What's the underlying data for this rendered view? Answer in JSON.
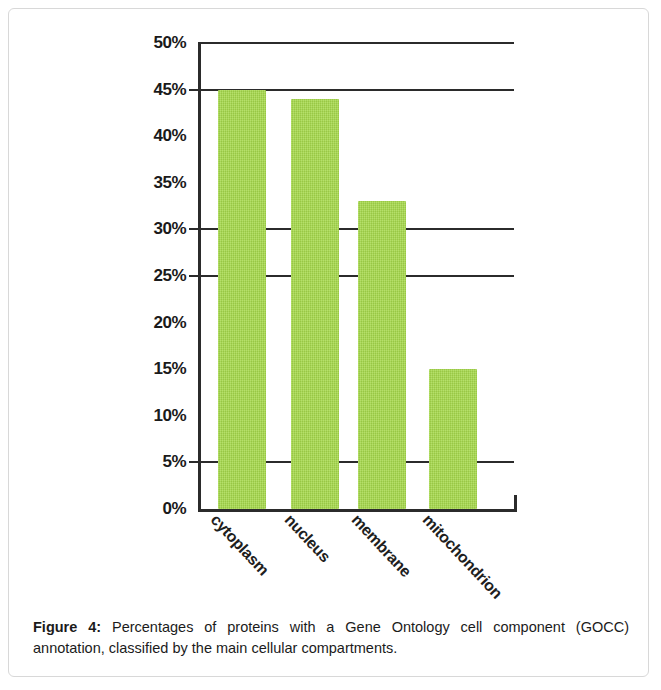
{
  "figure": {
    "caption_label": "Figure 4:",
    "caption_text": " Percentages of proteins with a Gene Ontology cell component (GOCC) annotation, classified by the main cellular compartments."
  },
  "chart_data": {
    "type": "bar",
    "title": "",
    "subtitle": "",
    "xlabel": "",
    "ylabel": "",
    "categories": [
      "cytoplasm",
      "nucleus",
      "membrane",
      "mitochondrion"
    ],
    "values": [
      45,
      44,
      33,
      15
    ],
    "value_unit": "%",
    "ylim": [
      0,
      50
    ],
    "ytick_values": [
      0,
      5,
      10,
      15,
      20,
      25,
      30,
      35,
      40,
      45,
      50
    ],
    "ytick_labels": [
      "0%",
      "5%",
      "10%",
      "15%",
      "20%",
      "25%",
      "30%",
      "35%",
      "40%",
      "45%",
      "50%"
    ],
    "gridline_values": [
      5,
      25,
      30,
      45,
      50
    ],
    "tickmark_values": [
      5,
      25,
      30,
      45
    ],
    "grid": true,
    "legend": false,
    "legend_position": "none",
    "bar_color": "#a6d94b",
    "axis_color": "#2b2b2b",
    "background_color": "#ffffff",
    "series": [
      {
        "name": "GOCC annotated proteins",
        "values": [
          45,
          44,
          33,
          15
        ]
      }
    ]
  }
}
